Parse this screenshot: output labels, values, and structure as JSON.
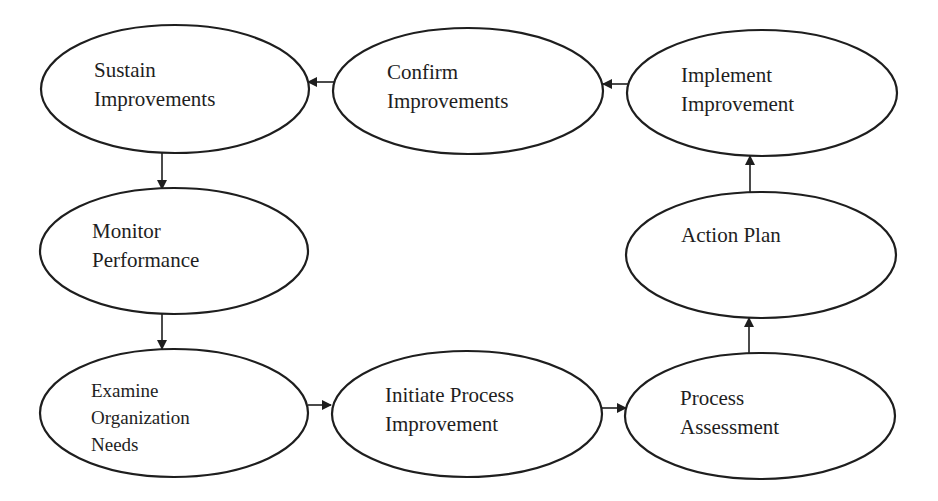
{
  "diagram": {
    "type": "process-cycle",
    "colors": {
      "stroke": "#1e1e1e",
      "fill": "#ffffff",
      "text": "#1e1e1e"
    },
    "nodes": [
      {
        "id": "sustain",
        "lines": [
          "Sustain",
          "Improvements"
        ],
        "cx": 175,
        "cy": 89,
        "rx": 134,
        "ry": 64,
        "label_x": 94,
        "label_y": 56
      },
      {
        "id": "confirm",
        "lines": [
          "Confirm",
          "Improvements"
        ],
        "cx": 468,
        "cy": 91,
        "rx": 135,
        "ry": 63,
        "label_x": 387,
        "label_y": 58
      },
      {
        "id": "implement",
        "lines": [
          "Implement",
          "Improvement"
        ],
        "cx": 762,
        "cy": 93,
        "rx": 135,
        "ry": 63,
        "label_x": 681,
        "label_y": 61
      },
      {
        "id": "monitor",
        "lines": [
          "Monitor",
          "Performance"
        ],
        "cx": 174,
        "cy": 251,
        "rx": 134,
        "ry": 63,
        "label_x": 92,
        "label_y": 217
      },
      {
        "id": "action",
        "lines": [
          "Action Plan"
        ],
        "cx": 761,
        "cy": 255,
        "rx": 135,
        "ry": 63,
        "label_x": 681,
        "label_y": 221
      },
      {
        "id": "examine",
        "lines": [
          "Examine",
          "Organization",
          "Needs"
        ],
        "cx": 174,
        "cy": 413,
        "rx": 134,
        "ry": 64,
        "label_x": 91,
        "label_y": 377,
        "small": true
      },
      {
        "id": "initiate",
        "lines": [
          "Initiate Process",
          "Improvement"
        ],
        "cx": 467,
        "cy": 414,
        "rx": 135,
        "ry": 63,
        "label_x": 385,
        "label_y": 381
      },
      {
        "id": "assess",
        "lines": [
          "Process",
          "Assessment"
        ],
        "cx": 760,
        "cy": 416,
        "rx": 135,
        "ry": 63,
        "label_x": 680,
        "label_y": 384
      }
    ],
    "edges": [
      {
        "from": "examine",
        "to": "initiate",
        "x1": 308,
        "y1": 405,
        "x2": 331,
        "y2": 405
      },
      {
        "from": "initiate",
        "to": "assess",
        "x1": 602,
        "y1": 408,
        "x2": 626,
        "y2": 408
      },
      {
        "from": "assess",
        "to": "action",
        "x1": 749,
        "y1": 353,
        "x2": 749,
        "y2": 318
      },
      {
        "from": "action",
        "to": "implement",
        "x1": 750,
        "y1": 192,
        "x2": 750,
        "y2": 156
      },
      {
        "from": "implement",
        "to": "confirm",
        "x1": 628,
        "y1": 84,
        "x2": 603,
        "y2": 84
      },
      {
        "from": "confirm",
        "to": "sustain",
        "x1": 334,
        "y1": 82,
        "x2": 308,
        "y2": 82
      },
      {
        "from": "sustain",
        "to": "monitor",
        "x1": 162,
        "y1": 153,
        "x2": 162,
        "y2": 189
      },
      {
        "from": "monitor",
        "to": "examine",
        "x1": 162,
        "y1": 314,
        "x2": 162,
        "y2": 349
      }
    ]
  },
  "labels": {
    "sustain": {
      "l1": "Sustain",
      "l2": "Improvements"
    },
    "confirm": {
      "l1": "Confirm",
      "l2": "Improvements"
    },
    "implement": {
      "l1": "Implement",
      "l2": "Improvement"
    },
    "monitor": {
      "l1": "Monitor",
      "l2": "Performance"
    },
    "action": {
      "l1": "Action Plan"
    },
    "examine": {
      "l1": "Examine",
      "l2": "Organization",
      "l3": "Needs"
    },
    "initiate": {
      "l1": "Initiate Process",
      "l2": "Improvement"
    },
    "assess": {
      "l1": "Process",
      "l2": "Assessment"
    }
  }
}
